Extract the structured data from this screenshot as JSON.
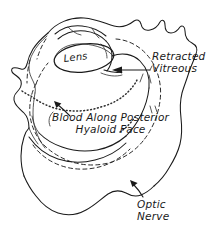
{
  "figure": {
    "style": "hand-drawn ink sketch",
    "background_color": "#ffffff",
    "ink_color": "#1a1a1a",
    "width": 221,
    "height": 242
  },
  "labels": {
    "lens": "Lens",
    "retracted_vitreous_line1": "Retracted",
    "retracted_vitreous_line2": "Vitreous",
    "blood_line1": "Blood Along Posterior",
    "blood_line2": "Hyaloid Face",
    "optic_nerve_line1": "Optic",
    "optic_nerve_line2": "Nerve"
  },
  "annotations": {
    "vitreous_arrow": "arrow-pointing-left-to-vitreous",
    "blood_arrow": "arrow-pointing-upleft-to-blood",
    "optic_nerve_arrow": "arrow-pointing-upleft-to-optic-nerve"
  },
  "structures": {
    "sclera": "outer-eye-wall-outline",
    "cornea": "anterior-corneal-curve",
    "lens_body": "lens-ellipse",
    "detached_hyaloid": "dashed-retracted-vitreous-boundary",
    "blood_layer": "dotted-blood-line"
  }
}
